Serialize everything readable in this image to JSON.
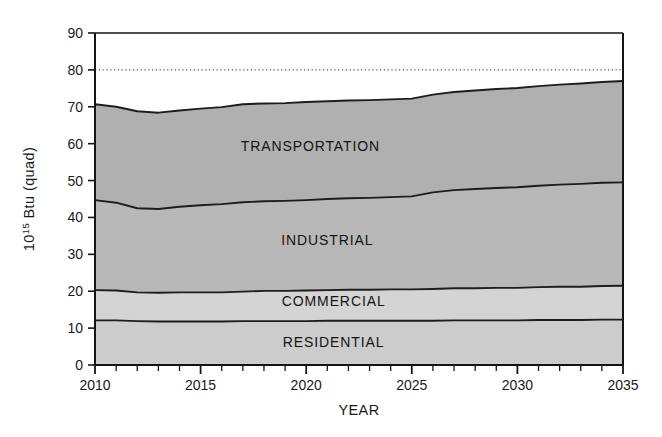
{
  "chart_data": {
    "type": "area",
    "title": "",
    "subtitle": "",
    "xlabel": "YEAR",
    "ylabel": "10^15 Btu (quad)",
    "ylabel_base": "10",
    "ylabel_exponent": "15",
    "ylabel_rest": " Btu (quad)",
    "stacked": true,
    "grid": false,
    "legend_position": "inline-band-labels",
    "xlim": [
      2010,
      2035
    ],
    "ylim": [
      0,
      90
    ],
    "x_major_ticks": [
      2010,
      2015,
      2020,
      2025,
      2030,
      2035
    ],
    "x_major_tick_labels": [
      "2010",
      "2015",
      "2020",
      "2025",
      "2030",
      "2035"
    ],
    "x_minor_tick_step": 1,
    "y_ticks": [
      0,
      10,
      20,
      30,
      40,
      50,
      60,
      70,
      80,
      90
    ],
    "y_tick_labels": [
      "0",
      "10",
      "20",
      "30",
      "40",
      "50",
      "60",
      "70",
      "80",
      "90"
    ],
    "reference_lines": [
      {
        "label": "80",
        "y": 80,
        "style": "dotted"
      }
    ],
    "x": [
      2010,
      2011,
      2012,
      2013,
      2014,
      2015,
      2016,
      2017,
      2018,
      2019,
      2020,
      2021,
      2022,
      2023,
      2024,
      2025,
      2026,
      2027,
      2028,
      2029,
      2030,
      2031,
      2032,
      2033,
      2034,
      2035
    ],
    "series": [
      {
        "name": "RESIDENTIAL",
        "label": "RESIDENTIAL",
        "fill": "#cccccc",
        "label_x": 2021.3,
        "label_y": 5.0,
        "values": [
          12.1,
          12.1,
          11.9,
          11.8,
          11.8,
          11.8,
          11.8,
          11.9,
          11.9,
          11.9,
          11.9,
          12.0,
          12.0,
          12.0,
          12.0,
          12.0,
          12.0,
          12.1,
          12.1,
          12.1,
          12.1,
          12.2,
          12.2,
          12.2,
          12.3,
          12.3
        ]
      },
      {
        "name": "COMMERCIAL",
        "label": "COMMERCIAL",
        "fill": "#d4d4d4",
        "label_x": 2021.3,
        "label_y": 15.9,
        "values": [
          8.2,
          8.1,
          7.8,
          7.8,
          7.9,
          7.9,
          7.9,
          8.0,
          8.2,
          8.2,
          8.3,
          8.3,
          8.4,
          8.4,
          8.5,
          8.5,
          8.6,
          8.7,
          8.7,
          8.8,
          8.8,
          8.9,
          9.0,
          9.0,
          9.1,
          9.2
        ]
      },
      {
        "name": "INDUSTRIAL",
        "label": "INDUSTRIAL",
        "fill": "#b8b8b8",
        "label_x": 2021.0,
        "label_y": 32.5,
        "values": [
          24.4,
          23.8,
          22.8,
          22.7,
          23.2,
          23.6,
          23.9,
          24.2,
          24.3,
          24.4,
          24.5,
          24.7,
          24.8,
          24.9,
          25.0,
          25.2,
          26.2,
          26.6,
          26.9,
          27.1,
          27.3,
          27.5,
          27.7,
          27.9,
          28.0,
          28.0
        ]
      },
      {
        "name": "TRANSPORTATION",
        "label": "TRANSPORTATION",
        "fill": "#b0b0b0",
        "label_x": 2020.2,
        "label_y": 58.0,
        "values": [
          26.0,
          26.0,
          26.3,
          26.1,
          26.1,
          26.2,
          26.3,
          26.6,
          26.5,
          26.5,
          26.6,
          26.5,
          26.5,
          26.5,
          26.5,
          26.5,
          26.5,
          26.6,
          26.7,
          26.8,
          26.9,
          27.0,
          27.1,
          27.2,
          27.3,
          27.5
        ]
      }
    ],
    "cumulative_tops": {
      "RESIDENTIAL": [
        12.1,
        12.1,
        11.9,
        11.8,
        11.8,
        11.8,
        11.8,
        11.9,
        11.9,
        11.9,
        11.9,
        12.0,
        12.0,
        12.0,
        12.0,
        12.0,
        12.0,
        12.1,
        12.1,
        12.1,
        12.1,
        12.2,
        12.2,
        12.2,
        12.3,
        12.3
      ],
      "COMMERCIAL": [
        20.3,
        20.2,
        19.7,
        19.6,
        19.7,
        19.7,
        19.7,
        19.9,
        20.1,
        20.1,
        20.2,
        20.3,
        20.4,
        20.4,
        20.5,
        20.5,
        20.6,
        20.8,
        20.8,
        20.9,
        20.9,
        21.1,
        21.2,
        21.2,
        21.4,
        21.5
      ],
      "INDUSTRIAL": [
        44.7,
        44.0,
        42.5,
        42.3,
        42.9,
        43.3,
        43.6,
        44.1,
        44.4,
        44.5,
        44.7,
        45.0,
        45.2,
        45.3,
        45.5,
        45.7,
        46.8,
        47.4,
        47.7,
        48.0,
        48.2,
        48.6,
        48.9,
        49.1,
        49.4,
        49.5
      ],
      "TRANSPORTATION": [
        70.7,
        70.0,
        68.8,
        68.4,
        69.0,
        69.5,
        69.9,
        70.7,
        70.9,
        71.0,
        71.3,
        71.5,
        71.7,
        71.8,
        72.0,
        72.2,
        73.3,
        74.0,
        74.4,
        74.8,
        75.1,
        75.6,
        76.0,
        76.3,
        76.7,
        77.0
      ]
    }
  }
}
